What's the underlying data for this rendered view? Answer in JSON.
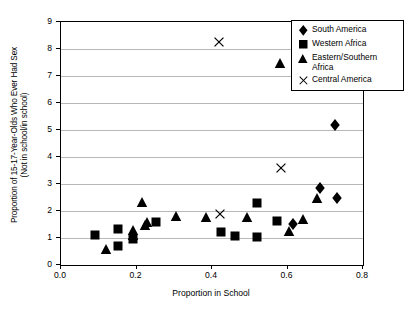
{
  "chart_data": {
    "type": "scatter",
    "title": "",
    "xlabel": "Proportion in School",
    "ylabel_line1": "Proportion of 15-17-Year-Olds Who Ever Had Sex",
    "ylabel_line2": "(Not in school/in school)",
    "xlim": [
      0.0,
      0.8
    ],
    "ylim": [
      0,
      9
    ],
    "xticks": [
      "0.0",
      "0.2",
      "0.4",
      "0.6",
      "0.8"
    ],
    "xtick_values": [
      0.0,
      0.2,
      0.4,
      0.6,
      0.8
    ],
    "yticks": [
      "0",
      "1",
      "2",
      "3",
      "4",
      "5",
      "6",
      "7",
      "8",
      "9"
    ],
    "ytick_values": [
      0,
      1,
      2,
      3,
      4,
      5,
      6,
      7,
      8,
      9
    ],
    "grid": "horizontal",
    "legend_position": "top-right",
    "marker_color": "#000000",
    "gridline_color": "#b8b8b8",
    "axis_color": "#000000",
    "series": [
      {
        "name": "South America",
        "marker": "diamond",
        "points": [
          {
            "x": 0.725,
            "y": 5.2
          },
          {
            "x": 0.685,
            "y": 2.85
          },
          {
            "x": 0.73,
            "y": 2.48
          },
          {
            "x": 0.615,
            "y": 1.52
          }
        ]
      },
      {
        "name": "Western Africa",
        "marker": "square",
        "points": [
          {
            "x": 0.09,
            "y": 1.1
          },
          {
            "x": 0.15,
            "y": 1.35
          },
          {
            "x": 0.152,
            "y": 0.7
          },
          {
            "x": 0.192,
            "y": 0.95
          },
          {
            "x": 0.252,
            "y": 1.58
          },
          {
            "x": 0.425,
            "y": 1.22
          },
          {
            "x": 0.462,
            "y": 1.08
          },
          {
            "x": 0.518,
            "y": 1.02
          },
          {
            "x": 0.518,
            "y": 2.3
          },
          {
            "x": 0.572,
            "y": 1.62
          }
        ]
      },
      {
        "name": "Eastern/Southern Africa",
        "marker": "triangle",
        "points": [
          {
            "x": 0.118,
            "y": 0.6
          },
          {
            "x": 0.19,
            "y": 1.28
          },
          {
            "x": 0.192,
            "y": 1.1
          },
          {
            "x": 0.215,
            "y": 2.35
          },
          {
            "x": 0.222,
            "y": 1.5
          },
          {
            "x": 0.228,
            "y": 1.58
          },
          {
            "x": 0.305,
            "y": 1.8
          },
          {
            "x": 0.385,
            "y": 1.78
          },
          {
            "x": 0.492,
            "y": 1.78
          },
          {
            "x": 0.58,
            "y": 7.5
          },
          {
            "x": 0.605,
            "y": 1.25
          },
          {
            "x": 0.64,
            "y": 1.72
          },
          {
            "x": 0.678,
            "y": 2.48
          }
        ]
      },
      {
        "name": "Central America",
        "marker": "x",
        "points": [
          {
            "x": 0.418,
            "y": 8.25
          },
          {
            "x": 0.582,
            "y": 3.58
          },
          {
            "x": 0.42,
            "y": 1.88
          }
        ]
      }
    ]
  },
  "legend": {
    "entries": [
      {
        "label": "South America",
        "marker": "diamond"
      },
      {
        "label": "Western Africa",
        "marker": "square"
      },
      {
        "label": "Eastern/Southern Africa",
        "marker": "triangle"
      },
      {
        "label": "Central America",
        "marker": "x"
      }
    ]
  }
}
